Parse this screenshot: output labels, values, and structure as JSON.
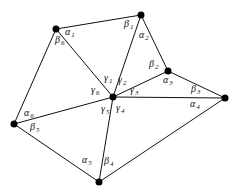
{
  "diagram": {
    "type": "triangulated star around interior vertex",
    "center": {
      "id": "C",
      "x": 113,
      "y": 97
    },
    "outer_vertices": [
      {
        "id": "V1",
        "x": 56,
        "y": 29
      },
      {
        "id": "V2",
        "x": 141,
        "y": 15
      },
      {
        "id": "V3",
        "x": 168,
        "y": 71
      },
      {
        "id": "V4",
        "x": 225,
        "y": 98
      },
      {
        "id": "V5",
        "x": 99,
        "y": 182
      },
      {
        "id": "V6",
        "x": 14,
        "y": 124
      }
    ],
    "labels": [
      {
        "greek": "α",
        "sub": "1",
        "x": 65,
        "y": 35
      },
      {
        "greek": "β",
        "sub": "1",
        "x": 124,
        "y": 27
      },
      {
        "greek": "α",
        "sub": "2",
        "x": 139,
        "y": 38
      },
      {
        "greek": "β",
        "sub": "2",
        "x": 149,
        "y": 67
      },
      {
        "greek": "α",
        "sub": "3",
        "x": 163,
        "y": 83
      },
      {
        "greek": "β",
        "sub": "3",
        "x": 191,
        "y": 92
      },
      {
        "greek": "α",
        "sub": "4",
        "x": 190,
        "y": 107
      },
      {
        "greek": "β",
        "sub": "4",
        "x": 104,
        "y": 164
      },
      {
        "greek": "α",
        "sub": "5",
        "x": 82,
        "y": 163
      },
      {
        "greek": "β",
        "sub": "5",
        "x": 30,
        "y": 130
      },
      {
        "greek": "α",
        "sub": "6",
        "x": 24,
        "y": 116
      },
      {
        "greek": "β",
        "sub": "6",
        "x": 55,
        "y": 43
      },
      {
        "greek": "γ",
        "sub": "1",
        "x": 104,
        "y": 81
      },
      {
        "greek": "γ",
        "sub": "2",
        "x": 118,
        "y": 83
      },
      {
        "greek": "γ",
        "sub": "3",
        "x": 130,
        "y": 93
      },
      {
        "greek": "γ",
        "sub": "4",
        "x": 116,
        "y": 111
      },
      {
        "greek": "γ",
        "sub": "5",
        "x": 101,
        "y": 112
      },
      {
        "greek": "γ",
        "sub": "6",
        "x": 91,
        "y": 93
      }
    ]
  }
}
